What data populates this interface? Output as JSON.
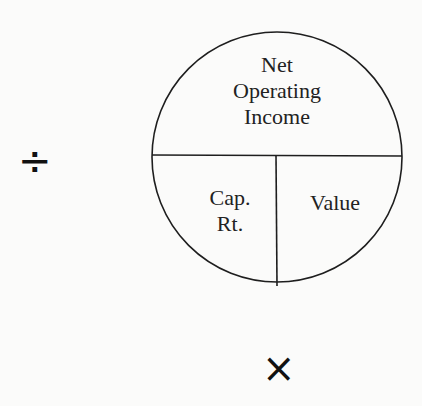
{
  "diagram": {
    "type": "IRV formula circle",
    "top_section": {
      "lines": [
        "Net",
        "Operating",
        "Income"
      ]
    },
    "bottom_left_section": {
      "lines": [
        "Cap.",
        "Rt."
      ]
    },
    "bottom_right_section": {
      "lines": [
        "Value"
      ]
    },
    "operators": {
      "divide": "÷",
      "multiply": "×"
    },
    "colors": {
      "line": "#1e1e1e",
      "background": "#fbfbfa"
    }
  }
}
